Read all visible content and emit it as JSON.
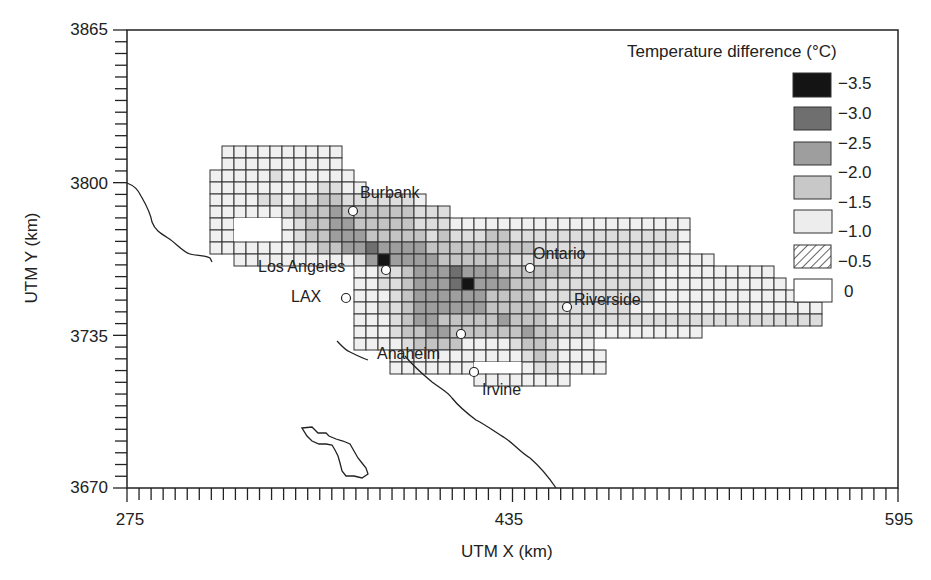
{
  "chart_data": {
    "type": "heatmap",
    "title": "",
    "xlabel": "UTM X (km)",
    "ylabel": "UTM Y (km)",
    "xlim": [
      275,
      595
    ],
    "ylim": [
      3670,
      3865
    ],
    "x_ticks": [
      275,
      435,
      595
    ],
    "y_ticks": [
      3670,
      3735,
      3800,
      3865
    ],
    "minor_tick_interval_km": 5,
    "grid_cell_km": 5,
    "grid": false,
    "legend": {
      "title": "Temperature difference (°C)",
      "position": "top-right",
      "entries": [
        {
          "label": "−3.5",
          "color": "#111111",
          "pattern": "solid"
        },
        {
          "label": "−3.0",
          "color": "#6e6e6e",
          "pattern": "solid"
        },
        {
          "label": "−2.5",
          "color": "#a2a2a2",
          "pattern": "solid"
        },
        {
          "label": "−2.0",
          "color": "#cfcfcf",
          "pattern": "solid"
        },
        {
          "label": "−1.5",
          "color": "#ebebeb",
          "pattern": "solid"
        },
        {
          "label": "−1.0",
          "color": "#ffffff",
          "pattern": "hatched"
        },
        {
          "label": "−0.5",
          "color": "#ffffff",
          "pattern": "blank"
        }
      ],
      "value_labels": [
        "−3.5",
        "−3.0",
        "−2.5",
        "−2.0",
        "−1.5",
        "−1.0",
        "−0.5",
        "0"
      ]
    },
    "cities": [
      {
        "name": "Burbank",
        "x_km": 378,
        "y_km": 3784
      },
      {
        "name": "Los Angeles",
        "x_km": 385,
        "y_km": 3768
      },
      {
        "name": "LAX",
        "x_km": 369,
        "y_km": 3756
      },
      {
        "name": "Ontario",
        "x_km": 440,
        "y_km": 3768
      },
      {
        "name": "Riverside",
        "x_km": 464,
        "y_km": 3753
      },
      {
        "name": "Anaheim",
        "x_km": 414,
        "y_km": 3736
      },
      {
        "name": "Irvine",
        "x_km": 420,
        "y_km": 3723
      }
    ],
    "peak_cooling": [
      {
        "near": "Los Angeles",
        "value": -3.5
      },
      {
        "near": "downtown-south",
        "value": -3.5
      }
    ]
  },
  "axes": {
    "x_title": "UTM X (km)",
    "y_title": "UTM Y (km)",
    "x_tick_labels": [
      "275",
      "435",
      "595"
    ],
    "y_tick_labels": [
      "3865",
      "3800",
      "3735",
      "3670"
    ]
  },
  "legend": {
    "title": "Temperature difference (°C)",
    "labels": [
      "−3.5",
      "−3.0",
      "−2.5",
      "−2.0",
      "−1.5",
      "−1.0",
      "−0.5",
      "0"
    ]
  },
  "cities": {
    "burbank": "Burbank",
    "los_angeles": "Los Angeles",
    "lax": "LAX",
    "ontario": "Ontario",
    "riverside": "Riverside",
    "anaheim": "Anaheim",
    "irvine": "Irvine"
  },
  "colors": {
    "level0": "#ffffff",
    "level1": "#f0f0f0",
    "level2": "#dddddd",
    "level3": "#c4c4c4",
    "level4": "#9e9e9e",
    "level5": "#6f6f6f",
    "level6": "#141414",
    "grid_line": "#333333"
  },
  "grid_map": {
    "origin_px": [
      210,
      146
    ],
    "cell_px": 12,
    "rows": [
      {
        "r": 0,
        "start": 1,
        "levels": [
          1,
          1,
          1,
          1,
          1,
          1,
          1,
          1,
          1,
          1
        ]
      },
      {
        "r": 1,
        "start": 1,
        "levels": [
          1,
          1,
          1,
          1,
          1,
          1,
          1,
          1,
          1,
          1
        ]
      },
      {
        "r": 2,
        "start": 0,
        "levels": [
          1,
          1,
          1,
          1,
          1,
          2,
          1,
          1,
          1,
          1,
          1,
          1
        ]
      },
      {
        "r": 3,
        "start": 0,
        "levels": [
          1,
          1,
          1,
          1,
          1,
          1,
          1,
          1,
          1,
          2,
          2,
          1,
          1
        ]
      },
      {
        "r": 4,
        "start": 0,
        "levels": [
          1,
          1,
          1,
          1,
          2,
          2,
          1,
          2,
          2,
          3,
          3,
          2,
          2,
          2,
          2,
          2,
          2,
          1
        ]
      },
      {
        "r": 5,
        "start": 0,
        "levels": [
          1,
          1,
          1,
          1,
          1,
          1,
          2,
          3,
          3,
          3,
          4,
          3,
          3,
          3,
          3,
          3,
          3,
          2,
          2,
          2
        ]
      },
      {
        "r": 6,
        "start": 0,
        "levels": [
          1,
          1,
          0,
          0,
          0,
          0,
          1,
          2,
          3,
          3,
          4,
          4,
          3,
          3,
          3,
          3,
          3,
          2,
          2,
          2,
          1,
          1,
          1,
          1,
          1,
          1,
          1,
          1,
          1,
          1,
          1,
          1,
          1,
          1,
          1,
          1,
          1,
          1,
          1,
          1
        ]
      },
      {
        "r": 7,
        "start": 0,
        "levels": [
          1,
          1,
          0,
          0,
          0,
          0,
          1,
          2,
          3,
          3,
          4,
          4,
          4,
          3,
          3,
          3,
          3,
          3,
          2,
          3,
          2,
          2,
          2,
          3,
          3,
          2,
          2,
          2,
          2,
          2,
          2,
          2,
          2,
          2,
          2,
          2,
          2,
          2,
          2,
          1
        ]
      },
      {
        "r": 8,
        "start": 0,
        "levels": [
          1,
          1,
          1,
          1,
          1,
          1,
          1,
          2,
          2,
          3,
          3,
          4,
          4,
          5,
          4,
          4,
          4,
          4,
          3,
          3,
          3,
          3,
          3,
          3,
          3,
          3,
          3,
          2,
          2,
          2,
          2,
          2,
          2,
          2,
          2,
          2,
          2,
          2,
          2,
          1
        ]
      },
      {
        "r": 9,
        "start": 2,
        "levels": [
          1,
          1,
          1,
          1,
          1,
          1,
          1,
          1,
          1,
          1,
          2,
          4,
          6,
          4,
          4,
          4,
          4,
          3,
          3,
          3,
          3,
          3,
          3,
          2,
          2,
          2,
          2,
          2,
          2,
          2,
          2,
          2,
          2,
          2,
          2,
          2,
          2,
          1,
          1,
          1
        ]
      },
      {
        "r": 10,
        "start": 12,
        "levels": [
          1,
          1,
          2,
          2,
          3,
          4,
          4,
          4,
          5,
          4,
          4,
          4,
          3,
          3,
          3,
          3,
          3,
          3,
          2,
          2,
          2,
          2,
          2,
          2,
          2,
          1,
          1,
          1,
          1,
          1,
          1,
          1,
          1,
          1,
          1
        ]
      },
      {
        "r": 11,
        "start": 12,
        "levels": [
          1,
          1,
          2,
          2,
          3,
          4,
          4,
          4,
          5,
          6,
          4,
          4,
          4,
          3,
          3,
          3,
          2,
          2,
          2,
          2,
          2,
          2,
          2,
          2,
          2,
          1,
          1,
          1,
          1,
          1,
          1,
          1,
          1,
          1,
          1,
          1
        ]
      },
      {
        "r": 12,
        "start": 12,
        "levels": [
          1,
          1,
          1,
          2,
          3,
          4,
          4,
          4,
          4,
          4,
          4,
          3,
          3,
          3,
          3,
          2,
          2,
          2,
          2,
          2,
          2,
          2,
          2,
          2,
          2,
          1,
          1,
          1,
          1,
          1,
          1,
          1,
          1,
          1,
          1,
          1,
          1,
          1,
          1
        ]
      },
      {
        "r": 13,
        "start": 12,
        "levels": [
          1,
          1,
          2,
          2,
          3,
          4,
          4,
          4,
          4,
          4,
          4,
          3,
          3,
          3,
          3,
          3,
          2,
          2,
          2,
          2,
          2,
          2,
          2,
          1,
          1,
          1,
          1,
          1,
          1,
          1,
          1,
          1,
          1,
          1,
          1,
          1,
          1,
          1,
          1
        ]
      },
      {
        "r": 14,
        "start": 12,
        "levels": [
          1,
          1,
          1,
          2,
          3,
          4,
          4,
          3,
          3,
          3,
          3,
          3,
          4,
          3,
          3,
          3,
          2,
          2,
          2,
          2,
          2,
          2,
          2,
          2,
          2,
          2,
          2,
          2,
          2,
          2,
          2,
          2,
          2,
          2,
          2,
          2,
          2,
          2,
          2
        ]
      },
      {
        "r": 15,
        "start": 12,
        "levels": [
          1,
          1,
          1,
          2,
          3,
          3,
          4,
          4,
          3,
          3,
          3,
          3,
          3,
          3,
          4,
          3,
          3,
          2,
          2,
          2,
          1,
          1,
          1,
          1,
          1,
          1,
          1,
          1,
          1
        ]
      },
      {
        "r": 16,
        "start": 12,
        "levels": [
          1,
          1,
          1,
          1,
          2,
          3,
          3,
          3,
          3,
          1,
          1,
          1,
          1,
          2,
          3,
          3,
          2,
          1,
          1,
          1
        ]
      },
      {
        "r": 17,
        "start": 15,
        "levels": [
          1,
          1,
          1,
          1,
          1,
          1,
          1,
          1,
          1,
          1,
          1,
          2,
          3,
          2,
          1,
          1,
          1,
          1
        ]
      },
      {
        "r": 18,
        "start": 15,
        "levels": [
          1,
          1,
          1,
          1,
          1,
          1,
          1,
          0,
          0,
          0,
          0,
          1,
          2,
          2,
          1,
          1,
          1,
          1
        ]
      },
      {
        "r": 19,
        "start": 22,
        "levels": [
          1,
          1,
          1,
          1,
          1,
          1,
          1,
          1
        ]
      }
    ]
  }
}
